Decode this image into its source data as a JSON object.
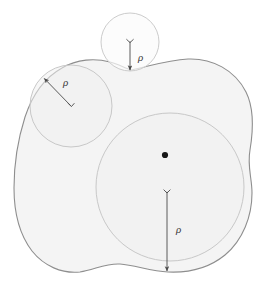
{
  "figure": {
    "background_color": "#ffffff",
    "region": {
      "name": "irregular-blob-region",
      "fill_color": "#f4f4f4",
      "stroke_color": "#8e8e8e",
      "stroke_width": 1.1,
      "bounds": {
        "x_min": 14,
        "x_max": 253,
        "y_min": 58,
        "y_max": 274
      }
    },
    "circle_fill_color": "#f0f0f0",
    "circle_stroke_color": "#c6c6c6",
    "arrow_color": "#4a4a4a",
    "dot_color": "#1a1a1a",
    "circles": [
      {
        "name": "top-small-circle",
        "cx": 130,
        "cy": 42,
        "r": 29,
        "label": "ρ",
        "label_x": 138,
        "label_y": 61,
        "arrow": {
          "x1": 130,
          "y1": 42,
          "x2": 130,
          "y2": 71
        },
        "center_marker": "tick"
      },
      {
        "name": "upper-left-circle",
        "cx": 71,
        "cy": 106,
        "r": 41,
        "label": "ρ",
        "label_x": 67,
        "label_y": 84,
        "arrow": {
          "x1": 71,
          "y1": 106,
          "x2": 43,
          "y2": 77
        },
        "center_marker": "tick"
      },
      {
        "name": "large-lower-right-circle",
        "cx": 170,
        "cy": 187,
        "r": 74,
        "label": "ρ",
        "label_x": 177,
        "label_y": 231,
        "arrow": {
          "x1": 167,
          "y1": 191,
          "x2": 167,
          "y2": 272
        },
        "center_marker": "dot",
        "dot_x": 165,
        "dot_y": 155
      }
    ],
    "labels": {
      "rho_symbol": "ρ",
      "rho_count": 3
    }
  }
}
